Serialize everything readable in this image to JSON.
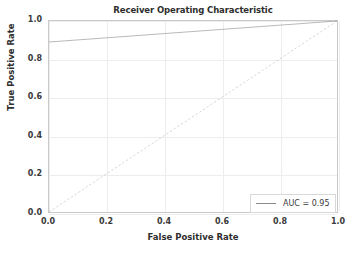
{
  "chart_data": {
    "type": "line",
    "title": "Receiver Operating Characteristic",
    "xlabel": "False Positive Rate",
    "ylabel": "True Positive Rate",
    "xlim": [
      0.0,
      1.0
    ],
    "ylim": [
      0.0,
      1.0
    ],
    "grid": true,
    "legend_position": "lower right",
    "xticks": [
      "0.0",
      "0.2",
      "0.4",
      "0.6",
      "0.8",
      "1.0"
    ],
    "xtick_values": [
      0.0,
      0.2,
      0.4,
      0.6,
      0.8,
      1.0
    ],
    "yticks": [
      "0.0",
      "0.2",
      "0.4",
      "0.6",
      "0.8",
      "1.0"
    ],
    "ytick_values": [
      0.0,
      0.2,
      0.4,
      0.6,
      0.8,
      1.0
    ],
    "series": [
      {
        "name": "AUC = 0.95",
        "style": "solid",
        "color": "#8a8a8a",
        "x": [
          0.0,
          0.2,
          0.4,
          0.6,
          0.8,
          1.0
        ],
        "y": [
          0.89,
          0.912,
          0.934,
          0.956,
          0.978,
          1.0
        ]
      },
      {
        "name": "chance-diagonal",
        "style": "dashed",
        "color": "#b5b5b5",
        "x": [
          0.0,
          1.0
        ],
        "y": [
          0.0,
          1.0
        ]
      }
    ],
    "legend": [
      {
        "label": "AUC = 0.95",
        "color": "#8a8a8a",
        "style": "solid"
      }
    ]
  }
}
